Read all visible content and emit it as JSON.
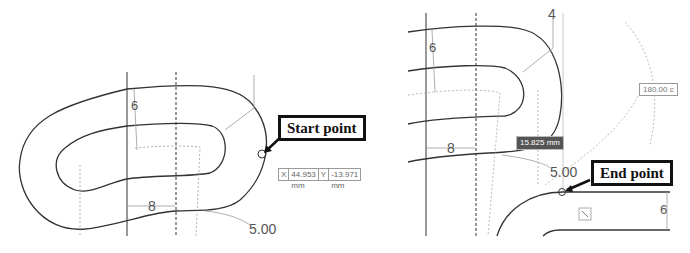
{
  "left_panel": {
    "callout": "Start point",
    "coords": {
      "x_label": "X",
      "x_value": "44.953 mm",
      "y_label": "Y",
      "y_value": "-13.971 mm"
    },
    "dims": {
      "width": "8",
      "height": "6",
      "radius": "5.00",
      "offset": "4"
    }
  },
  "right_panel": {
    "callout": "End point",
    "length_tag": "15.825 mm",
    "angle_tag": "180.00 c",
    "dims": {
      "width": "8",
      "height": "6",
      "radius": "5.00",
      "offset": "4",
      "height_right": "6"
    }
  },
  "colors": {
    "stroke": "#333333",
    "construction": "#999999",
    "callout_border": "#111111"
  }
}
